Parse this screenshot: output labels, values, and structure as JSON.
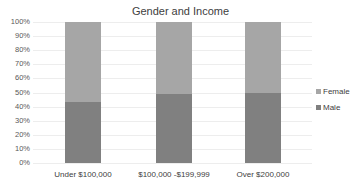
{
  "chart_data": {
    "type": "bar",
    "stacked": true,
    "normalized": true,
    "title": "Gender and Income",
    "xlabel": "",
    "ylabel": "",
    "categories": [
      "Under $100,000",
      "$100,000 -$199,999",
      "Over $200,000"
    ],
    "series": [
      {
        "name": "Male",
        "color": "#808080",
        "values": [
          43,
          49,
          50
        ]
      },
      {
        "name": "Female",
        "color": "#a6a6a6",
        "values": [
          57,
          51,
          50
        ]
      }
    ],
    "ylim": [
      0,
      100
    ],
    "yticks": [
      "0%",
      "10%",
      "20%",
      "30%",
      "40%",
      "50%",
      "60%",
      "70%",
      "80%",
      "90%",
      "100%"
    ],
    "grid": true,
    "legend_position": "right",
    "legend": [
      "Female",
      "Male"
    ]
  }
}
